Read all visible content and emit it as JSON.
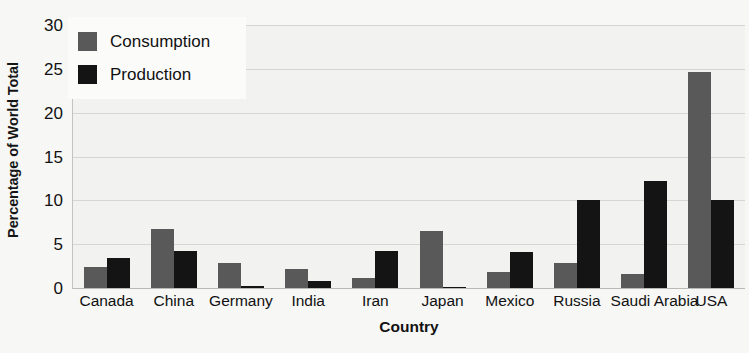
{
  "chart_data": {
    "type": "bar",
    "title": "",
    "xlabel": "Country",
    "ylabel": "Percentage of World Total",
    "categories": [
      "Canada",
      "China",
      "Germany",
      "India",
      "Iran",
      "Japan",
      "Mexico",
      "Russia",
      "Saudi Arabia",
      "USA"
    ],
    "series": [
      {
        "name": "Consumption",
        "color": "#595959",
        "values": [
          2.4,
          6.7,
          2.9,
          2.2,
          1.1,
          6.5,
          1.8,
          2.8,
          1.6,
          24.6
        ]
      },
      {
        "name": "Production",
        "color": "#141414",
        "values": [
          3.4,
          4.2,
          0.2,
          0.8,
          4.2,
          0.1,
          4.1,
          10.0,
          12.2,
          10.0
        ]
      }
    ],
    "ylim": [
      0,
      30
    ],
    "yticks": [
      0,
      5,
      10,
      15,
      20,
      25,
      30
    ],
    "ytick_labels": [
      "0",
      "5",
      "10",
      "15",
      "20",
      "25",
      "30"
    ],
    "grid": true,
    "legend_position": "top-left",
    "legend_entries": [
      "Consumption",
      "Production"
    ],
    "bar_group_mode": "grouped",
    "plot_background": "#f2f2f0",
    "gridline_color": "#d6d6d4",
    "figure_background": "#f7f7f5"
  }
}
